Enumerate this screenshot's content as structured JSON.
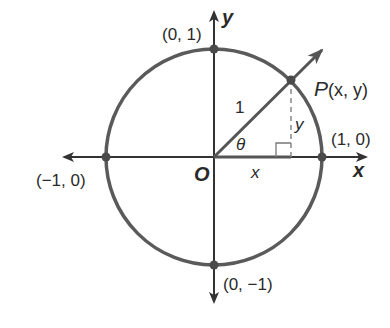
{
  "diagram": {
    "colors": {
      "circle": "#5a5a5a",
      "axes": "#333333",
      "ray": "#555555",
      "points": "#4a4a4a",
      "dashed": "#888888",
      "text": "#2a2a2a"
    },
    "geometry": {
      "center": [
        214,
        157
      ],
      "radius": 108,
      "point_P": [
        291,
        80
      ]
    },
    "labels": {
      "top_point": "(0, 1)",
      "bottom_point": "(0, −1)",
      "left_point": "(−1, 0)",
      "right_point": "(1, 0)",
      "point_P_letter": "P",
      "point_P_coords": "(x, y)",
      "origin": "O",
      "x_axis": "x",
      "y_axis": "y",
      "radius": "1",
      "angle": "θ",
      "x_leg": "x",
      "y_leg": "y"
    }
  }
}
